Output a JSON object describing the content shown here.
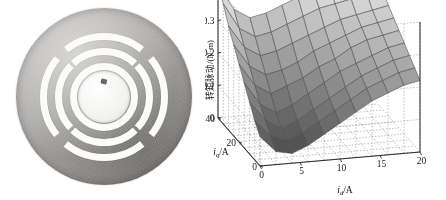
{
  "figure": {
    "left_panel": {
      "name": "rotor-lamination-photo",
      "description": "grayscale photograph of a motor rotor lamination disc",
      "features": {
        "disc": "circular steel lamination",
        "pole_count": 4,
        "arcs_per_pole": 3,
        "shaft_hole": "central round bore",
        "key_notch": "small notch at bore edge"
      },
      "colors": {
        "steel_light": "#b9b7b5",
        "steel_mid": "#a9a7a5",
        "steel_dark": "#8e8c8a",
        "slot_fill": "#fbfbfa"
      }
    },
    "right_panel": {
      "name": "torque-ripple-surface-plot"
    }
  },
  "chart_data": {
    "type": "surface",
    "title": "",
    "xlabel": "i_d/A",
    "ylabel": "i_q/A",
    "zlabel": "转矩脉动/(N·m)",
    "xlabel_html": "i<sub>d</sub>/A",
    "ylabel_html": "i<sub>q</sub>/A",
    "x": [
      0,
      5,
      10,
      15,
      20
    ],
    "y": [
      0,
      20,
      40
    ],
    "xticks": [
      "0",
      "5",
      "10",
      "15",
      "20"
    ],
    "yticks": [
      "0",
      "20",
      "40"
    ],
    "zticks": [
      "0",
      "0.1",
      "0.2",
      "0.3",
      "0.4"
    ],
    "xlim": [
      0,
      20
    ],
    "ylim": [
      0,
      40
    ],
    "zlim": [
      0,
      0.4
    ],
    "grid": true,
    "grid_style": "dotted",
    "legend": "none",
    "colormap": "gray",
    "colorbar": false,
    "x_grid_values": [
      0,
      2,
      4,
      6,
      8,
      10,
      12,
      14,
      16,
      18,
      20
    ],
    "y_grid_values": [
      0,
      5,
      10,
      15,
      20,
      25,
      30,
      35,
      40
    ],
    "z_matrix_note": "rows = i_q from 40 (back) to 0 (front); cols = i_d from 0 (left) to 20 (right)",
    "z": [
      [
        0.41,
        0.33,
        0.3,
        0.31,
        0.33,
        0.35,
        0.36,
        0.37,
        0.38,
        0.38,
        0.39
      ],
      [
        0.37,
        0.29,
        0.26,
        0.27,
        0.29,
        0.31,
        0.33,
        0.34,
        0.35,
        0.36,
        0.36
      ],
      [
        0.32,
        0.25,
        0.22,
        0.23,
        0.25,
        0.27,
        0.29,
        0.31,
        0.32,
        0.33,
        0.34
      ],
      [
        0.28,
        0.21,
        0.18,
        0.19,
        0.21,
        0.24,
        0.26,
        0.28,
        0.3,
        0.31,
        0.32
      ],
      [
        0.24,
        0.17,
        0.14,
        0.16,
        0.18,
        0.21,
        0.23,
        0.26,
        0.28,
        0.29,
        0.3
      ],
      [
        0.2,
        0.13,
        0.1,
        0.12,
        0.15,
        0.18,
        0.21,
        0.23,
        0.25,
        0.27,
        0.28
      ],
      [
        0.16,
        0.1,
        0.07,
        0.09,
        0.12,
        0.15,
        0.18,
        0.21,
        0.23,
        0.25,
        0.26
      ],
      [
        0.12,
        0.07,
        0.05,
        0.07,
        0.1,
        0.13,
        0.16,
        0.19,
        0.21,
        0.23,
        0.24
      ],
      [
        0.09,
        0.04,
        0.03,
        0.05,
        0.08,
        0.11,
        0.14,
        0.17,
        0.19,
        0.21,
        0.22
      ]
    ]
  }
}
